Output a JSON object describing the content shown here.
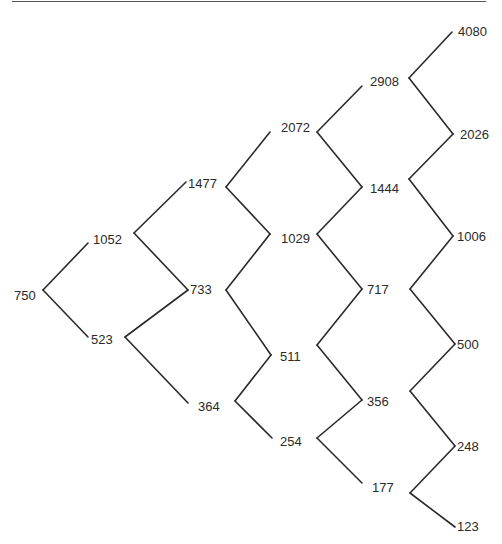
{
  "diagram": {
    "type": "binomial-tree",
    "steps": 5,
    "nodes": [
      {
        "id": "n0_0",
        "value": "750",
        "x": 43,
        "y": 290,
        "lx": 14,
        "ly": 300
      },
      {
        "id": "n1_0",
        "value": "1052",
        "x": 88,
        "y": 243,
        "lx": 93,
        "ly": 244
      },
      {
        "id": "n1_1",
        "value": "523",
        "x": 88,
        "y": 337,
        "lx": 91,
        "ly": 344
      },
      {
        "id": "n2_0",
        "value": "1477",
        "x": 186,
        "y": 182,
        "lx": 188,
        "ly": 188
      },
      {
        "id": "n2_1",
        "value": "733",
        "x": 188,
        "y": 290,
        "lx": 190,
        "ly": 294
      },
      {
        "id": "n2_2",
        "value": "364",
        "x": 188,
        "y": 403,
        "lx": 198,
        "ly": 411
      },
      {
        "id": "n3_0",
        "value": "2072",
        "x": 270,
        "y": 132,
        "lx": 281,
        "ly": 132
      },
      {
        "id": "n3_1",
        "value": "1029",
        "x": 270,
        "y": 234,
        "lx": 281,
        "ly": 243
      },
      {
        "id": "n3_2",
        "value": "511",
        "x": 271,
        "y": 355,
        "lx": 280,
        "ly": 361
      },
      {
        "id": "n3_3",
        "value": "254",
        "x": 272,
        "y": 438,
        "lx": 280,
        "ly": 446
      },
      {
        "id": "n4_0",
        "value": "2908",
        "x": 362,
        "y": 86,
        "lx": 370,
        "ly": 86
      },
      {
        "id": "n4_1",
        "value": "1444",
        "x": 362,
        "y": 187,
        "lx": 370,
        "ly": 193
      },
      {
        "id": "n4_2",
        "value": "717",
        "x": 362,
        "y": 289,
        "lx": 367,
        "ly": 294
      },
      {
        "id": "n4_3",
        "value": "356",
        "x": 362,
        "y": 400,
        "lx": 367,
        "ly": 406
      },
      {
        "id": "n4_4",
        "value": "177",
        "x": 362,
        "y": 483,
        "lx": 372,
        "ly": 492
      },
      {
        "id": "n5_0",
        "value": "4080",
        "x": 452,
        "y": 32,
        "lx": 458,
        "ly": 36
      },
      {
        "id": "n5_1",
        "value": "2026",
        "x": 453,
        "y": 134,
        "lx": 460,
        "ly": 139
      },
      {
        "id": "n5_2",
        "value": "1006",
        "x": 453,
        "y": 236,
        "lx": 457,
        "ly": 241
      },
      {
        "id": "n5_3",
        "value": "500",
        "x": 455,
        "y": 344,
        "lx": 457,
        "ly": 349
      },
      {
        "id": "n5_4",
        "value": "248",
        "x": 455,
        "y": 446,
        "lx": 457,
        "ly": 451
      },
      {
        "id": "n5_5",
        "value": "123",
        "x": 455,
        "y": 527,
        "lx": 457,
        "ly": 531
      }
    ],
    "edges": [
      [
        [
          43,
          290
        ],
        [
          88,
          243
        ]
      ],
      [
        [
          43,
          290
        ],
        [
          88,
          337
        ]
      ],
      [
        [
          134,
          233
        ],
        [
          186,
          182
        ]
      ],
      [
        [
          134,
          233
        ],
        [
          188,
          290
        ]
      ],
      [
        [
          125,
          337
        ],
        [
          188,
          290
        ]
      ],
      [
        [
          125,
          337
        ],
        [
          188,
          403
        ]
      ],
      [
        [
          226,
          187
        ],
        [
          270,
          132
        ]
      ],
      [
        [
          226,
          187
        ],
        [
          270,
          234
        ]
      ],
      [
        [
          226,
          290
        ],
        [
          270,
          234
        ]
      ],
      [
        [
          226,
          290
        ],
        [
          271,
          355
        ]
      ],
      [
        [
          235,
          401
        ],
        [
          271,
          355
        ]
      ],
      [
        [
          235,
          401
        ],
        [
          272,
          438
        ]
      ],
      [
        [
          317,
          132
        ],
        [
          362,
          86
        ]
      ],
      [
        [
          317,
          132
        ],
        [
          362,
          187
        ]
      ],
      [
        [
          317,
          234
        ],
        [
          362,
          187
        ]
      ],
      [
        [
          317,
          234
        ],
        [
          362,
          289
        ]
      ],
      [
        [
          317,
          345
        ],
        [
          362,
          289
        ]
      ],
      [
        [
          317,
          345
        ],
        [
          362,
          400
        ]
      ],
      [
        [
          317,
          438
        ],
        [
          362,
          400
        ]
      ],
      [
        [
          317,
          438
        ],
        [
          362,
          483
        ]
      ],
      [
        [
          409,
          78
        ],
        [
          452,
          32
        ]
      ],
      [
        [
          409,
          78
        ],
        [
          453,
          134
        ]
      ],
      [
        [
          409,
          179
        ],
        [
          453,
          134
        ]
      ],
      [
        [
          409,
          179
        ],
        [
          453,
          236
        ]
      ],
      [
        [
          410,
          289
        ],
        [
          453,
          236
        ]
      ],
      [
        [
          410,
          289
        ],
        [
          455,
          344
        ]
      ],
      [
        [
          410,
          391
        ],
        [
          455,
          344
        ]
      ],
      [
        [
          410,
          391
        ],
        [
          455,
          446
        ]
      ],
      [
        [
          410,
          493
        ],
        [
          455,
          446
        ]
      ],
      [
        [
          410,
          493
        ],
        [
          455,
          527
        ]
      ]
    ],
    "top_rule": {
      "x1": 12,
      "x2": 486,
      "y": 1.5
    }
  }
}
